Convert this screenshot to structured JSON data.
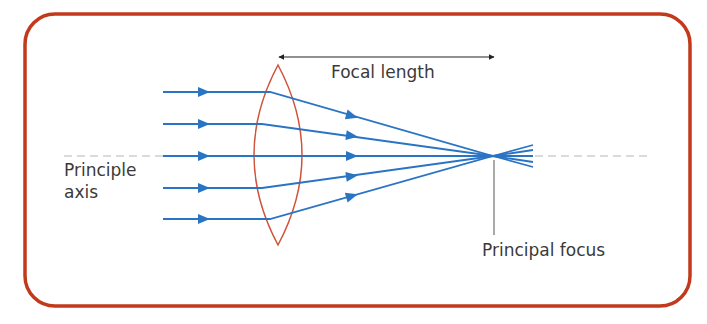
{
  "diagram": {
    "colors": {
      "frame": "#c23a1c",
      "lens": "#d0533a",
      "rays": "#2a74c4",
      "axis": "#b8b8b8",
      "annotation": "#333333",
      "text": "#3a3a3a"
    },
    "labels": {
      "focal_length": "Focal length",
      "principle_axis_line1": "Principle",
      "principle_axis_line2": "axis",
      "principal_focus": "Principal focus"
    },
    "geometry": {
      "frame": {
        "x": 25,
        "y": 14,
        "width": 665,
        "height": 292,
        "radius": 30
      },
      "lens": {
        "cx": 278,
        "top": 65,
        "bottom": 245,
        "half_width": 24
      },
      "axis_y": 156,
      "focus": {
        "x": 493,
        "y": 156
      },
      "ray_start_x": 163,
      "ray_end_x": 533,
      "rays_y": [
        92,
        124,
        156,
        188,
        219
      ],
      "focal_length_arrow": {
        "x1": 278,
        "x2": 495,
        "y": 57
      }
    }
  }
}
